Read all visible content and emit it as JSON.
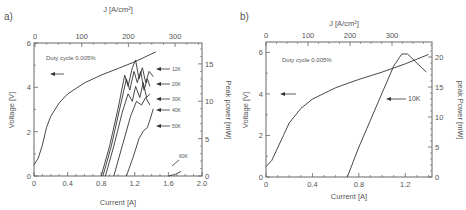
{
  "chart_data": [
    {
      "panel": "a)",
      "type": "line",
      "top_axis": {
        "label": "J [A/cm²]",
        "ticks": [
          "0",
          "100",
          "200",
          "300"
        ]
      },
      "xlabel": "Current [A]",
      "xticks": [
        "0",
        "0.4",
        "0.8",
        "1.2",
        "1.6",
        "2.0"
      ],
      "xlim": [
        0,
        2.0
      ],
      "ylabel_left": "Voltage [V]",
      "yticks_left": [
        "0",
        "2",
        "4",
        "6"
      ],
      "ylim_left": [
        0,
        6
      ],
      "ylabel_right": "Peak power [mW]",
      "yticks_right": [
        "0",
        "5",
        "10",
        "15"
      ],
      "ylim_right": [
        0,
        17.8
      ],
      "annotation": "Duty cycle 0.005%",
      "series": [
        {
          "name": "Voltage",
          "axis": "left",
          "x": [
            0,
            0.05,
            0.1,
            0.15,
            0.2,
            0.3,
            0.4,
            0.6,
            0.8,
            1.0,
            1.2,
            1.45
          ],
          "y": [
            0.5,
            0.8,
            1.4,
            2.2,
            2.7,
            3.3,
            3.7,
            4.2,
            4.55,
            4.85,
            5.15,
            5.6
          ]
        },
        {
          "name": "12K",
          "axis": "right",
          "x": [
            0.8,
            0.9,
            1.0,
            1.08,
            1.12,
            1.17,
            1.21,
            1.25,
            1.29,
            1.33,
            1.37,
            1.42
          ],
          "y": [
            0,
            4,
            9,
            13.5,
            12,
            14.5,
            15.5,
            13,
            14.5,
            12.5,
            14,
            13.3
          ]
        },
        {
          "name": "20K",
          "axis": "right",
          "x": [
            0.82,
            0.92,
            1.02,
            1.1,
            1.14,
            1.19,
            1.23,
            1.27,
            1.31,
            1.35,
            1.38
          ],
          "y": [
            0,
            4,
            9,
            13,
            11.5,
            14,
            12.5,
            14,
            11.5,
            13,
            12
          ]
        },
        {
          "name": "30K",
          "axis": "right",
          "x": [
            0.85,
            0.95,
            1.05,
            1.12,
            1.17,
            1.21,
            1.26,
            1.3,
            1.34,
            1.38
          ],
          "y": [
            0,
            4,
            8.5,
            11,
            10,
            12,
            10.5,
            12.5,
            10.5,
            11
          ]
        },
        {
          "name": "40K",
          "axis": "right",
          "x": [
            0.95,
            1.05,
            1.15,
            1.22,
            1.28,
            1.33,
            1.38
          ],
          "y": [
            0,
            4,
            8,
            10,
            9.5,
            10.5,
            9.5
          ]
        },
        {
          "name": "50K",
          "axis": "right",
          "x": [
            1.1,
            1.18,
            1.25,
            1.3,
            1.35,
            1.38,
            1.42
          ],
          "y": [
            0,
            2.5,
            5,
            6,
            6.5,
            7.5,
            9
          ]
        },
        {
          "name": "60K",
          "axis": "right",
          "x": [
            1.6,
            1.68,
            1.75
          ],
          "y": [
            0,
            0.2,
            0.6
          ]
        }
      ],
      "legend_labels": [
        "12K",
        "20K",
        "30K",
        "40K",
        "50K",
        "60K"
      ]
    },
    {
      "panel": "b)",
      "type": "line",
      "top_axis": {
        "label": "J [A/cm²]",
        "ticks": [
          "0",
          "100",
          "200",
          "300"
        ]
      },
      "xlabel": "Current [A]",
      "xticks": [
        "0",
        "0.4",
        "0.8",
        "1.2"
      ],
      "xlim": [
        0,
        1.43
      ],
      "ylabel_left": "Voltage [V]",
      "yticks_left": [
        "0",
        "2",
        "4",
        "6"
      ],
      "ylim_left": [
        0,
        6.5
      ],
      "ylabel_right": "peak Power [mW]",
      "yticks_right": [
        "0",
        "5",
        "10",
        "15",
        "20"
      ],
      "ylim_right": [
        0,
        22.5
      ],
      "annotation": "Duty cycle 0.005%",
      "series": [
        {
          "name": "Voltage",
          "axis": "left",
          "x": [
            0,
            0.05,
            0.1,
            0.15,
            0.2,
            0.3,
            0.4,
            0.6,
            0.8,
            1.0,
            1.2,
            1.4
          ],
          "y": [
            0.5,
            0.8,
            1.4,
            2.0,
            2.6,
            3.3,
            3.75,
            4.3,
            4.7,
            5.05,
            5.45,
            5.9
          ]
        },
        {
          "name": "10K",
          "axis": "right",
          "x": [
            0.7,
            0.8,
            0.9,
            1.0,
            1.1,
            1.17,
            1.22,
            1.3,
            1.38
          ],
          "y": [
            0,
            5,
            9.5,
            14,
            18.5,
            20.5,
            20.5,
            19,
            17.5
          ]
        }
      ],
      "legend_labels": [
        "10K"
      ]
    }
  ],
  "panels": {
    "a": {
      "tag": "a)",
      "top_label": "J [A/cm²]",
      "xlabel": "Current [A]",
      "ylabel_left": "Voltage [V]",
      "ylabel_right": "Peak power [mW]",
      "note": "Duty cycle 0.005%"
    },
    "b": {
      "tag": "b)",
      "top_label": "J [A/cm²]",
      "xlabel": "Current [A]",
      "ylabel_left": "Voltage [V]",
      "ylabel_right": "peak Power [mW]",
      "note": "Duty cycle 0.005%"
    }
  }
}
